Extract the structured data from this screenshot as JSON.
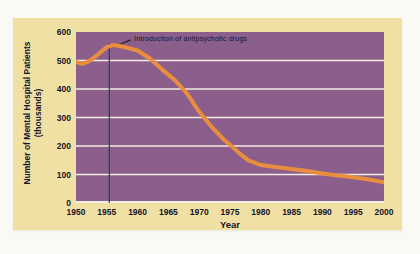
{
  "colors": {
    "page_background": "#fafaf5",
    "card_background": "#f1e0a4",
    "plot_background": "#8c5e8c",
    "gridline": "#f3eee3",
    "data_line": "#e98e3e",
    "marker_line": "#2c3a68",
    "leader_line": "#1a1a1a",
    "text": "#14142a"
  },
  "chart_data": {
    "type": "line",
    "title": "",
    "xlabel": "Year",
    "ylabel": "Number of Mental Hospital Patients (thousands)",
    "ylabel_lines": [
      "Number of Mental Hospital Patients",
      "(thousands)"
    ],
    "xlim": [
      1950,
      2000
    ],
    "ylim": [
      0,
      600
    ],
    "x_ticks": [
      1950,
      1955,
      1960,
      1965,
      1970,
      1975,
      1980,
      1985,
      1990,
      1995,
      2000
    ],
    "y_ticks": [
      600,
      500,
      400,
      300,
      200,
      100,
      0
    ],
    "gridline_values": [
      500,
      400,
      300,
      200,
      100
    ],
    "grid": "horizontal-only",
    "legend": null,
    "series": [
      {
        "name": "Number of mental hospital patients (thousands)",
        "x": [
          1950,
          1955,
          1960,
          1965,
          1970,
          1975,
          1980,
          1985,
          1990,
          1995,
          2000
        ],
        "values": [
          495,
          550,
          535,
          450,
          320,
          205,
          135,
          120,
          105,
          90,
          73
        ]
      }
    ],
    "curve_points": [
      [
        1950,
        495
      ],
      [
        1951,
        488
      ],
      [
        1952,
        496
      ],
      [
        1953.5,
        520
      ],
      [
        1955,
        547
      ],
      [
        1956,
        554
      ],
      [
        1957.5,
        549
      ],
      [
        1960,
        535
      ],
      [
        1962,
        507
      ],
      [
        1964,
        468
      ],
      [
        1966,
        432
      ],
      [
        1968,
        385
      ],
      [
        1970,
        320
      ],
      [
        1972,
        268
      ],
      [
        1974,
        222
      ],
      [
        1975,
        205
      ],
      [
        1976.5,
        175
      ],
      [
        1978,
        150
      ],
      [
        1980,
        133
      ],
      [
        1982,
        127
      ],
      [
        1985,
        119
      ],
      [
        1987.5,
        112
      ],
      [
        1990,
        104
      ],
      [
        1992.5,
        97
      ],
      [
        1995,
        90
      ],
      [
        1997.5,
        82
      ],
      [
        2000,
        73
      ]
    ],
    "annotation": {
      "text": "Introduction of antipsychotic drugs",
      "marker_year": 1955.4,
      "marker_top_value": 560
    }
  }
}
